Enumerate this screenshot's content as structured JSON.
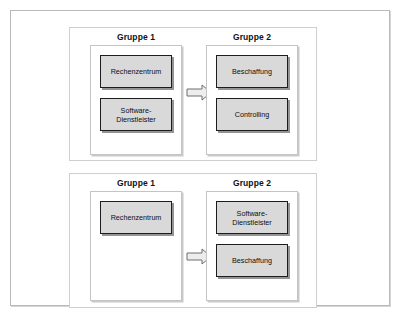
{
  "figure": {
    "scenarios": [
      {
        "name": "scenario-top",
        "arrow": "block-arrow-right-icon",
        "groups": [
          {
            "title": "Gruppe 1",
            "units": [
              {
                "label": "Rechenzentrum",
                "lines": [
                  "Rechenzentrum"
                ]
              },
              {
                "label": "Software-Dienstleister",
                "lines": [
                  "Software-",
                  "Dienstleister"
                ]
              }
            ]
          },
          {
            "title": "Gruppe 2",
            "units": [
              {
                "label": "Beschaffung",
                "lines": [
                  "Beschaffung"
                ]
              },
              {
                "label": "Controlling",
                "lines": [
                  "Controlling"
                ]
              }
            ]
          }
        ]
      },
      {
        "name": "scenario-bottom",
        "arrow": "block-arrow-right-icon",
        "groups": [
          {
            "title": "Gruppe 1",
            "units": [
              {
                "label": "Rechenzentrum",
                "lines": [
                  "Rechenzentrum"
                ]
              }
            ]
          },
          {
            "title": "Gruppe 2",
            "units": [
              {
                "label": "Software-Dienstleister",
                "lines": [
                  "Software-",
                  "Dienstleister"
                ]
              },
              {
                "label": "Beschaffung",
                "lines": [
                  "Beschaffung"
                ]
              }
            ]
          }
        ]
      }
    ]
  },
  "colors": {
    "unit_fill": "#d9d9d9",
    "unit_border": "#1c1c1c",
    "panel_border": "#c4c4c4",
    "frame_border": "#b9b9b9",
    "arrow_fill": "#ededed",
    "arrow_border": "#6f6f6f",
    "text": "#0d0d0d",
    "background": "#ffffff"
  }
}
